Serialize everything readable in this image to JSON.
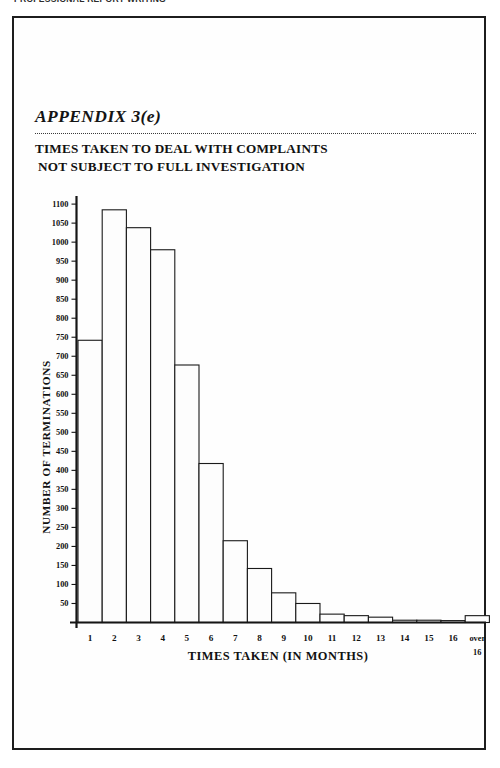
{
  "running_head": "PROFESSIONAL REPORT WRITING",
  "appendix": {
    "label": "APPENDIX 3(e)",
    "title_line1": "TIMES TAKEN TO DEAL WITH COMPLAINTS",
    "title_line2": "NOT SUBJECT TO FULL INVESTIGATION"
  },
  "chart_data": {
    "type": "bar",
    "title": "TIMES TAKEN TO DEAL WITH COMPLAINTS NOT SUBJECT TO FULL INVESTIGATION",
    "xlabel": "TIMES TAKEN (IN MONTHS)",
    "ylabel": "NUMBER OF TERMINATIONS",
    "categories": [
      "1",
      "2",
      "3",
      "4",
      "5",
      "6",
      "7",
      "8",
      "9",
      "10",
      "11",
      "12",
      "13",
      "14",
      "15",
      "16",
      "over 16"
    ],
    "values": [
      742,
      1085,
      1038,
      980,
      677,
      418,
      215,
      142,
      78,
      50,
      22,
      18,
      14,
      6,
      6,
      5,
      18
    ],
    "ylim": [
      0,
      1120
    ],
    "ytick_values": [
      50,
      100,
      150,
      200,
      250,
      300,
      350,
      400,
      450,
      500,
      550,
      600,
      650,
      700,
      750,
      800,
      850,
      900,
      950,
      1000,
      1050,
      1100
    ],
    "ytick_labels": [
      "50",
      "100",
      "150",
      "200",
      "250",
      "300",
      "350",
      "400",
      "450",
      "500",
      "550",
      "600",
      "650",
      "700",
      "750",
      "800",
      "850",
      "900",
      "950",
      "1000",
      "1050",
      "1100"
    ],
    "grid": false,
    "legend": false,
    "bar_fill": "#fdfdfd",
    "bar_stroke": "#1a1a1a",
    "last_label_line1": "over",
    "last_label_line2": "16"
  }
}
